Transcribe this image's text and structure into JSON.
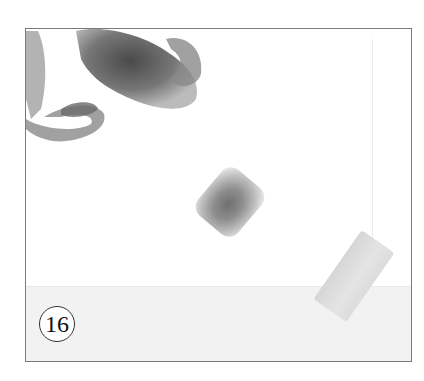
{
  "figure": {
    "step_number": "16",
    "colors": {
      "border": "#7a7a7a",
      "background": "#ffffff",
      "band": "#f2f2f2",
      "stain": "#6f6f6f",
      "tape": "#dcdcdc"
    }
  }
}
